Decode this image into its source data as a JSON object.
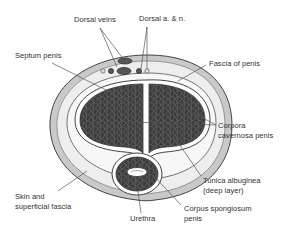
{
  "diagram": {
    "type": "anatomical-cross-section",
    "colors": {
      "background": "#ffffff",
      "skin": "#c9c9c9",
      "fascia": "#eeeeee",
      "erectile_tissue": "#3c3c3c",
      "tissue_mesh": "#6a6a6a",
      "outline": "#444444",
      "label_text": "#333333",
      "leader_line": "#555555"
    },
    "labels": [
      {
        "id": "dorsal-veins",
        "lines": [
          "Dorsal veins"
        ],
        "x": 74,
        "y": 22,
        "anchor": "start",
        "leaders": [
          [
            100,
            28,
            124,
            60
          ],
          [
            100,
            28,
            117,
            67
          ]
        ]
      },
      {
        "id": "dorsal-artery-nerve",
        "lines": [
          "Dorsal a. & n."
        ],
        "x": 139,
        "y": 21,
        "anchor": "start",
        "leaders": [
          [
            147,
            27,
            141,
            69
          ],
          [
            147,
            27,
            147,
            69
          ]
        ]
      },
      {
        "id": "septum-penis",
        "lines": [
          "Septum penis"
        ],
        "x": 15,
        "y": 58,
        "anchor": "start",
        "leaders": [
          [
            52,
            63,
            130,
            102
          ]
        ]
      },
      {
        "id": "fascia-of-penis",
        "lines": [
          "Fascia of penis"
        ],
        "x": 209,
        "y": 66,
        "anchor": "start",
        "leaders": [
          [
            206,
            65,
            178,
            81
          ]
        ]
      },
      {
        "id": "corpora-cavernosa",
        "lines": [
          "Corpora",
          "cavernosa penis"
        ],
        "x": 218,
        "y": 128,
        "anchor": "start",
        "leaders": [
          [
            216,
            125,
            130,
            122
          ],
          [
            216,
            125,
            192,
            112
          ]
        ]
      },
      {
        "id": "tunica-albuginea",
        "lines": [
          "Tunica albuginea",
          "(deep layer)"
        ],
        "x": 203,
        "y": 183,
        "anchor": "start",
        "leaders": [
          [
            201,
            176,
            175,
            138
          ]
        ]
      },
      {
        "id": "skin-superficial-fascia",
        "lines": [
          "Skin and",
          "superficial fascia"
        ],
        "x": 15,
        "y": 199,
        "anchor": "start",
        "leaders": [
          [
            58,
            191,
            87,
            171
          ]
        ]
      },
      {
        "id": "urethra",
        "lines": [
          "Urethra"
        ],
        "x": 130,
        "y": 221,
        "anchor": "start",
        "leaders": [
          [
            141,
            213,
            136,
            178
          ]
        ]
      },
      {
        "id": "corpus-spongiosum",
        "lines": [
          "Corpus spongiosum",
          "penis"
        ],
        "x": 184,
        "y": 211,
        "anchor": "start",
        "leaders": [
          [
            181,
            205,
            154,
            176
          ]
        ]
      }
    ]
  }
}
